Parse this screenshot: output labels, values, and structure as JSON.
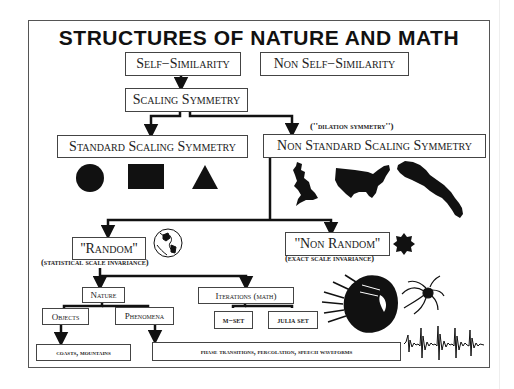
{
  "title": "STRUCTURES OF NATURE AND MATH",
  "nodes": {
    "self_similarity": "Self−Similarity",
    "non_self_similarity": "Non Self−Similarity",
    "scaling_symmetry": "Scaling Symmetry",
    "standard_scaling_symmetry": "Standard Scaling Symmetry",
    "non_standard_scaling_symmetry": "Non Standard Scaling Symmetry",
    "dilation_symmetry_note": "(''dilation symmetry'')",
    "random": "''Random''",
    "random_note": "(statistical scale invariance)",
    "non_random": "''Non Random''",
    "non_random_note": "(exact scale invariance)",
    "nature": "Nature",
    "iterations": "Iterations (math)",
    "objects": "Objects",
    "phenomena": "Phenomena",
    "m_set": "m−set",
    "julia_set": "julia set",
    "coasts_mountains": "coasts, mountains",
    "phase_transitions": "phase transitions, percolation, speech waveforms"
  },
  "illustrations": {
    "standard_shapes": [
      "circle",
      "rectangle",
      "triangle"
    ],
    "non_standard_shapes": [
      "great-britain-map",
      "usa-map",
      "coastline-map"
    ],
    "random_icon": "globe",
    "non_random_icon": "koch-snowflake",
    "iteration_images": [
      "mandelbrot-set",
      "julia-set"
    ],
    "phenomena_image": "speech-waveform"
  },
  "colors": {
    "ink": "#111111",
    "box_border": "#444444",
    "background": "#ffffff"
  }
}
